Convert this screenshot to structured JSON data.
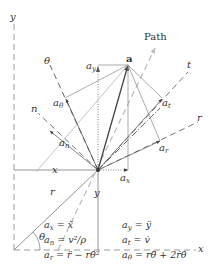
{
  "diagram": {
    "labels": {
      "y_axis": "y",
      "x_axis": "x",
      "point": "a",
      "path": "Path",
      "theta_axis": "θ",
      "n_axis": "n",
      "t_axis": "t",
      "r_axis_upper": "r",
      "r_axis_lower": "r",
      "x_dim": "x",
      "y_dim": "y",
      "theta_angle": "θ",
      "a_x": "a",
      "a_x_sub": "x",
      "a_y": "a",
      "a_y_sub": "y",
      "a_n": "a",
      "a_n_sub": "n",
      "a_t": "a",
      "a_t_sub": "t",
      "a_r": "a",
      "a_r_sub": "r",
      "a_theta": "a",
      "a_theta_sub": "θ"
    },
    "equations": [
      {
        "lhs": "a",
        "sub": "x",
        "rhs": "= ẍ"
      },
      {
        "lhs": "a",
        "sub": "y",
        "rhs": "= ÿ"
      },
      {
        "lhs": "a",
        "sub": "n",
        "rhs": "= v²/ρ"
      },
      {
        "lhs": "a",
        "sub": "t",
        "rhs": "= v̇"
      },
      {
        "lhs": "a",
        "sub": "r",
        "rhs": "= r̈ − rθ̇²"
      },
      {
        "lhs": "a",
        "sub": "θ",
        "rhs": "= rθ̈ + 2ṙθ̇"
      }
    ],
    "colors": {
      "line": "#555555",
      "light_line": "#aaaaaa",
      "text": "#333333"
    }
  }
}
